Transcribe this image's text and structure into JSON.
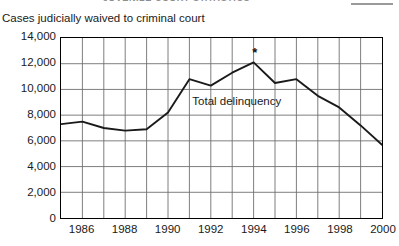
{
  "page_header": {
    "cut_text": "JUVENILE COURT STATISTICS",
    "rule_icon": "horizontal-rule"
  },
  "chart_data": {
    "type": "line",
    "title": "Cases judicially waived to criminal court",
    "xlabel": "",
    "ylabel": "",
    "ylim": [
      0,
      14000
    ],
    "xlim": [
      1985,
      2000
    ],
    "grid": true,
    "legend_position": "inline",
    "y_ticks": [
      "0",
      "2,000",
      "4,000",
      "6,000",
      "8,000",
      "10,000",
      "12,000",
      "14,000"
    ],
    "y_tick_values": [
      0,
      2000,
      4000,
      6000,
      8000,
      10000,
      12000,
      14000
    ],
    "x_ticks": [
      "1986",
      "1988",
      "1990",
      "1992",
      "1994",
      "1996",
      "1998",
      "2000"
    ],
    "x_tick_values": [
      1986,
      1988,
      1990,
      1992,
      1994,
      1996,
      1998,
      2000
    ],
    "x": [
      1985,
      1986,
      1987,
      1988,
      1989,
      1990,
      1991,
      1992,
      1993,
      1994,
      1995,
      1996,
      1997,
      1998,
      1999,
      2000
    ],
    "series": [
      {
        "name": "Total delinquency",
        "values": [
          7300,
          7500,
          7000,
          6800,
          6900,
          8200,
          10800,
          10300,
          11300,
          12100,
          10500,
          10800,
          9500,
          8600,
          7200,
          5700
        ]
      }
    ],
    "annotations": [
      {
        "text": "Total delinquency",
        "x": 1991.1,
        "y": 9100
      },
      {
        "text": "*",
        "x": 1994,
        "y": 12900,
        "note": "asterisk marker above 1994 peak"
      }
    ]
  }
}
